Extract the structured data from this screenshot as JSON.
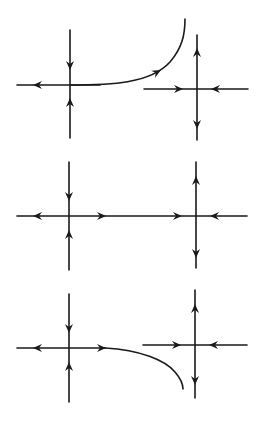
{
  "diagram": {
    "line_color": "#1a1a1a",
    "background": "#ffffff",
    "panels": [
      {
        "id": "top",
        "description": "Unstable manifold of left saddle bends upward, missing right saddle",
        "left_saddle": {
          "x": 70,
          "y": 86,
          "v_top": 30,
          "v_bottom": 138,
          "h_left": 17
        },
        "right_saddle": {
          "x": 197,
          "y": 89,
          "v_top": 35,
          "v_bottom": 140,
          "h_left": 144,
          "h_right": 248
        },
        "connection": "curve-up",
        "curve_end": {
          "x": 185,
          "y": 19
        }
      },
      {
        "id": "middle",
        "description": "Heteroclinic connection: unstable manifold of left saddle joins stable manifold of right saddle",
        "left_saddle": {
          "x": 69,
          "y": 216,
          "v_top": 162,
          "v_bottom": 270,
          "h_left": 17
        },
        "right_saddle": {
          "x": 196,
          "y": 216,
          "v_top": 162,
          "v_bottom": 268,
          "h_right": 247
        },
        "connection": "straight"
      },
      {
        "id": "bottom",
        "description": "Unstable manifold of left saddle bends downward, missing right saddle",
        "left_saddle": {
          "x": 69,
          "y": 348,
          "v_top": 294,
          "v_bottom": 402,
          "h_left": 17
        },
        "right_saddle": {
          "x": 195,
          "y": 345,
          "v_top": 290,
          "v_bottom": 398,
          "h_left": 143,
          "h_right": 247
        },
        "connection": "curve-down",
        "curve_end": {
          "x": 183,
          "y": 389
        }
      }
    ]
  }
}
